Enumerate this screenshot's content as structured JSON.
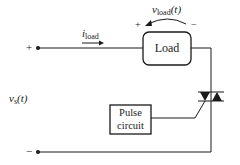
{
  "diagram": {
    "type": "circuit",
    "source": {
      "label_main": "v",
      "label_sub": "s",
      "label_tail": "(t)",
      "plus": "+",
      "minus": "−"
    },
    "current": {
      "label_main": "i",
      "label_sub": "load"
    },
    "load_voltage": {
      "label_main": "v",
      "label_sub": "load",
      "label_tail": "(t)",
      "plus": "+",
      "minus": "−"
    },
    "load_box": {
      "label": "Load"
    },
    "pulse_box": {
      "line1": "Pulse",
      "line2": "circuit"
    },
    "switch": {
      "component": "triac"
    },
    "colors": {
      "stroke": "#1a1a1a",
      "background": "#ffffff"
    }
  }
}
